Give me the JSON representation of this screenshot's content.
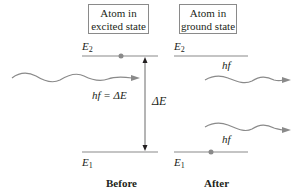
{
  "before": {
    "box_line1": "Atom in",
    "box_line2": "excited state",
    "upper_level": "E",
    "upper_level_sub": "2",
    "lower_level": "E",
    "lower_level_sub": "1",
    "incident_photon_label": "hf = ΔE",
    "energy_gap_label": "ΔE",
    "caption": "Before"
  },
  "after": {
    "box_line1": "Atom in",
    "box_line2": "ground state",
    "upper_level": "E",
    "upper_level_sub": "2",
    "lower_level": "E",
    "lower_level_sub": "1",
    "photon_label_1": "hf",
    "photon_label_2": "hf",
    "caption": "After"
  },
  "colors": {
    "line": "#8a8a8a",
    "dot": "#8a8a8a",
    "text": "#231f20",
    "arrow": "#231f20"
  }
}
